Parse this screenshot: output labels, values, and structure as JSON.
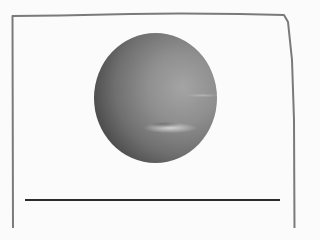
{
  "image": {
    "subject": "planet",
    "description": "grayscale photo of a gas giant planet inside a hand-drawn frame",
    "colors": {
      "frame": "#7a7a7a",
      "rule": "#2b2b2b",
      "background": "#fbfbfb"
    }
  }
}
